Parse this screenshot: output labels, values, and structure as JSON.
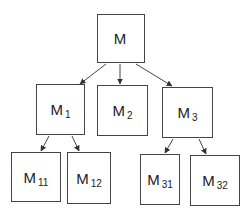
{
  "diagram": {
    "type": "tree",
    "nodes": [
      {
        "id": "M",
        "label": "M",
        "sub": "",
        "x": 97,
        "y": 14,
        "w": 48,
        "h": 49
      },
      {
        "id": "M1",
        "label": "M",
        "sub": "1",
        "x": 36,
        "y": 84,
        "w": 49,
        "h": 51
      },
      {
        "id": "M2",
        "label": "M",
        "sub": "2",
        "x": 97,
        "y": 85,
        "w": 51,
        "h": 51
      },
      {
        "id": "M3",
        "label": "M",
        "sub": "3",
        "x": 162,
        "y": 87,
        "w": 51,
        "h": 51
      },
      {
        "id": "M11",
        "label": "M",
        "sub": "11",
        "x": 11,
        "y": 152,
        "w": 50,
        "h": 50
      },
      {
        "id": "M12",
        "label": "M",
        "sub": "12",
        "x": 67,
        "y": 152,
        "w": 44,
        "h": 52
      },
      {
        "id": "M31",
        "label": "M",
        "sub": "31",
        "x": 140,
        "y": 154,
        "w": 40,
        "h": 51
      },
      {
        "id": "M32",
        "label": "M",
        "sub": "32",
        "x": 190,
        "y": 155,
        "w": 50,
        "h": 51
      }
    ],
    "edges": [
      {
        "from": "M",
        "to": "M1",
        "x1": 106,
        "y1": 64,
        "x2": 80,
        "y2": 84
      },
      {
        "from": "M",
        "to": "M2",
        "x1": 120,
        "y1": 64,
        "x2": 120,
        "y2": 84
      },
      {
        "from": "M",
        "to": "M3",
        "x1": 136,
        "y1": 64,
        "x2": 172,
        "y2": 86
      },
      {
        "from": "M1",
        "to": "M11",
        "x1": 49,
        "y1": 136,
        "x2": 41,
        "y2": 151
      },
      {
        "from": "M1",
        "to": "M12",
        "x1": 72,
        "y1": 136,
        "x2": 79,
        "y2": 151
      },
      {
        "from": "M3",
        "to": "M31",
        "x1": 173,
        "y1": 139,
        "x2": 165,
        "y2": 153
      },
      {
        "from": "M3",
        "to": "M32",
        "x1": 199,
        "y1": 139,
        "x2": 206,
        "y2": 154
      }
    ]
  }
}
